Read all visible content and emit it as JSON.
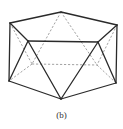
{
  "figure": {
    "caption": "(b)",
    "colors": {
      "solid_edge": "#2a2a2a",
      "hidden_edge": "#8a8a8a",
      "background": "#ffffff"
    },
    "vertices": [
      "top-apex",
      "left-top",
      "right-top",
      "front-left-upper",
      "front-right-upper",
      "back-left-lower",
      "back-right-lower",
      "left-bottom",
      "right-bottom",
      "bottom-apex"
    ],
    "visible_edges": [
      [
        "left-top",
        "top-apex"
      ],
      [
        "top-apex",
        "right-top"
      ],
      [
        "left-top",
        "left-bottom"
      ],
      [
        "right-top",
        "right-bottom"
      ],
      [
        "left-top",
        "front-left-upper"
      ],
      [
        "right-top",
        "front-right-upper"
      ],
      [
        "front-left-upper",
        "front-right-upper"
      ],
      [
        "front-left-upper",
        "left-bottom"
      ],
      [
        "front-right-upper",
        "right-bottom"
      ],
      [
        "front-left-upper",
        "bottom-apex"
      ],
      [
        "front-right-upper",
        "bottom-apex"
      ],
      [
        "left-bottom",
        "bottom-apex"
      ],
      [
        "right-bottom",
        "bottom-apex"
      ]
    ],
    "hidden_edges": [
      [
        "top-apex",
        "back-left-lower"
      ],
      [
        "top-apex",
        "back-right-lower"
      ],
      [
        "left-top",
        "back-left-lower"
      ],
      [
        "right-top",
        "back-right-lower"
      ],
      [
        "back-left-lower",
        "back-right-lower"
      ],
      [
        "back-left-lower",
        "left-bottom"
      ],
      [
        "back-right-lower",
        "right-bottom"
      ]
    ]
  }
}
